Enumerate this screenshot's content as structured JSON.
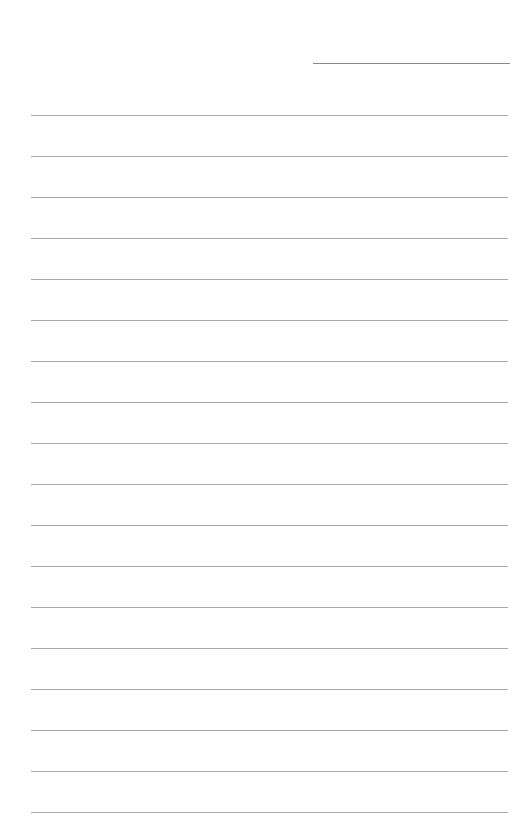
{
  "page": {
    "type": "lined-paper",
    "background_color": "#ffffff",
    "header_line": {
      "label": "",
      "color": "#8a8a8a"
    },
    "rule_color": "#a8a8a8",
    "rules": [
      {
        "index": 1,
        "text": ""
      },
      {
        "index": 2,
        "text": ""
      },
      {
        "index": 3,
        "text": ""
      },
      {
        "index": 4,
        "text": ""
      },
      {
        "index": 5,
        "text": ""
      },
      {
        "index": 6,
        "text": ""
      },
      {
        "index": 7,
        "text": ""
      },
      {
        "index": 8,
        "text": ""
      },
      {
        "index": 9,
        "text": ""
      },
      {
        "index": 10,
        "text": ""
      },
      {
        "index": 11,
        "text": ""
      },
      {
        "index": 12,
        "text": ""
      },
      {
        "index": 13,
        "text": ""
      },
      {
        "index": 14,
        "text": ""
      },
      {
        "index": 15,
        "text": ""
      },
      {
        "index": 16,
        "text": ""
      },
      {
        "index": 17,
        "text": ""
      },
      {
        "index": 18,
        "text": ""
      }
    ]
  }
}
